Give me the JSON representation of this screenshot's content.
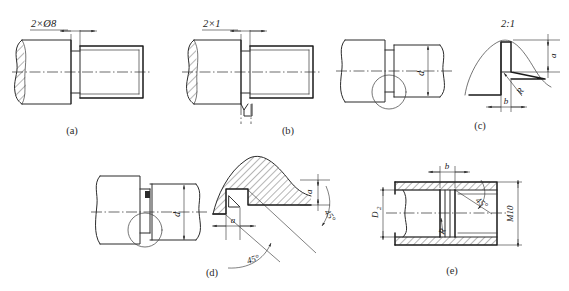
{
  "sheet": {
    "title": "Thread relief groove (undercut) detail drawings",
    "background_color": "#ffffff",
    "line_color": "#2b2b2b"
  },
  "figures": [
    {
      "id": "a",
      "caption": "(a)",
      "description": "External thread run-out with 2 x diameter 8 relief groove, shaft in half section",
      "labels": [
        {
          "name": "groove-callout",
          "text": "2×Ø8"
        }
      ]
    },
    {
      "id": "b",
      "caption": "(b)",
      "description": "External thread with 2 x 1 relief groove and vertical centre mark",
      "labels": [
        {
          "name": "groove-callout",
          "text": "2×1"
        }
      ]
    },
    {
      "id": "c",
      "caption": "(c)",
      "description": "Shaft with relief groove, detail circle enlarged at scale 2:1",
      "labels": [
        {
          "name": "diameter-dim",
          "text": "d"
        },
        {
          "name": "scale-note",
          "text": "2:1"
        },
        {
          "name": "groove-depth-dim",
          "text": "a"
        },
        {
          "name": "groove-radius",
          "text": "R"
        },
        {
          "name": "groove-width-dim",
          "text": "b"
        }
      ]
    },
    {
      "id": "d",
      "caption": "(d)",
      "description": "Shaft with relief groove and enlarged sectioned detail with 45 degree chamfers",
      "labels": [
        {
          "name": "diameter-dim",
          "text": "d"
        },
        {
          "name": "groove-depth-dim-right",
          "text": "a"
        },
        {
          "name": "groove-depth-dim-left",
          "text": "a"
        },
        {
          "name": "angle-upper",
          "text": "45°"
        },
        {
          "name": "angle-lower",
          "text": "45°"
        }
      ]
    },
    {
      "id": "e",
      "caption": "(e)",
      "description": "Internal thread relief groove in sectioned bore, M10 thread",
      "labels": [
        {
          "name": "groove-width-dim",
          "text": "b"
        },
        {
          "name": "bore-diameter-dim",
          "text": "D"
        },
        {
          "name": "bore-diameter-subscript",
          "text": "2"
        },
        {
          "name": "thread-callout",
          "text": "M10"
        },
        {
          "name": "chamfer-angle",
          "text": "45°"
        },
        {
          "name": "groove-radius",
          "text": "R"
        }
      ]
    }
  ]
}
